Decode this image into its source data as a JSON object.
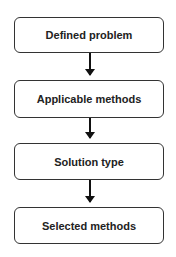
{
  "diagram": {
    "type": "flowchart",
    "nodes": [
      {
        "id": "n1",
        "label": "Defined problem"
      },
      {
        "id": "n2",
        "label": "Applicable methods"
      },
      {
        "id": "n3",
        "label": "Solution type"
      },
      {
        "id": "n4",
        "label": "Selected methods"
      }
    ],
    "edges": [
      {
        "from": "n1",
        "to": "n2"
      },
      {
        "from": "n2",
        "to": "n3"
      },
      {
        "from": "n3",
        "to": "n4"
      }
    ]
  }
}
